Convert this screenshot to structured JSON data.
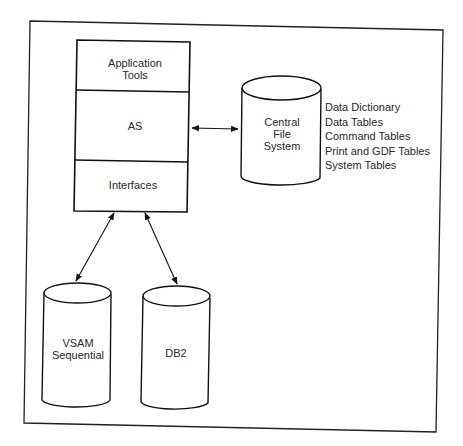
{
  "diagram": {
    "stack": {
      "layers": [
        {
          "label_line1": "Application",
          "label_line2": "Tools"
        },
        {
          "label": "AS"
        },
        {
          "label": "Interfaces"
        }
      ]
    },
    "central_file_system": {
      "line1": "Central",
      "line2": "File",
      "line3": "System",
      "contents": [
        "Data Dictionary",
        "Data Tables",
        "Command Tables",
        "Print and GDF Tables",
        "System Tables"
      ]
    },
    "vsam": {
      "line1": "VSAM",
      "line2": "Sequential"
    },
    "db2": {
      "label": "DB2"
    },
    "connections": [
      {
        "from": "AS",
        "to": "Central File System",
        "type": "bidirectional"
      },
      {
        "from": "Interfaces",
        "to": "VSAM Sequential",
        "type": "bidirectional"
      },
      {
        "from": "Interfaces",
        "to": "DB2",
        "type": "bidirectional"
      }
    ]
  }
}
